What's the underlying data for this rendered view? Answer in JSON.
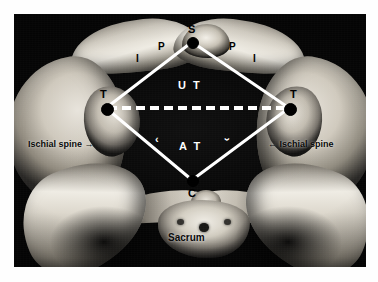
{
  "figure": {
    "background_color": "#050505",
    "overlay_line_color": "#ffffff",
    "label_color_dark": "#000000",
    "label_color_light": "#ffffff"
  },
  "vertices": [
    {
      "id": "S",
      "label": "S",
      "meaning": "symphysis-pubis",
      "x": 192,
      "y": 42
    },
    {
      "id": "T-left",
      "label": "T",
      "meaning": "ischial-tuberosity-left",
      "x": 106,
      "y": 108
    },
    {
      "id": "T-right",
      "label": "T",
      "meaning": "ischial-tuberosity-right",
      "x": 289,
      "y": 108
    },
    {
      "id": "C",
      "label": "C",
      "meaning": "coccyx",
      "x": 192,
      "y": 180
    }
  ],
  "region_labels": [
    {
      "id": "upper-triangle",
      "label": "U T",
      "x": 192,
      "y": 86
    },
    {
      "id": "anterior-triangle",
      "label": "A T",
      "x": 192,
      "y": 147
    }
  ],
  "bone_labels": [
    {
      "id": "pubic-ramus-left",
      "label": "P",
      "x": 162,
      "y": 48
    },
    {
      "id": "ischium-left",
      "label": "I",
      "x": 139,
      "y": 60
    },
    {
      "id": "pubic-ramus-right",
      "label": "P",
      "x": 232,
      "y": 48
    },
    {
      "id": "ischium-right",
      "label": "I",
      "x": 256,
      "y": 60
    }
  ],
  "angle_marks": [
    {
      "id": "angle-mark-left",
      "glyph": "‹",
      "x": 158,
      "y": 140
    },
    {
      "id": "angle-mark-right",
      "glyph": "‹",
      "x": 228,
      "y": 140
    }
  ],
  "annotations": [
    {
      "id": "ischial-spine-left",
      "text": "Ischial spine",
      "arrow": "→",
      "arrow_side": "right",
      "x": 34,
      "y": 145
    },
    {
      "id": "ischial-spine-right",
      "text": "Ischial spine",
      "arrow": "←",
      "arrow_side": "left",
      "x": 272,
      "y": 145
    },
    {
      "id": "sacrum",
      "text": "Sacrum",
      "arrow": "",
      "arrow_side": "none",
      "x": 192,
      "y": 238
    }
  ],
  "lines": {
    "solid_edges": [
      {
        "id": "edge-s-tleft",
        "from": "S",
        "to": "T-left"
      },
      {
        "id": "edge-s-tright",
        "from": "S",
        "to": "T-right"
      },
      {
        "id": "edge-c-tleft",
        "from": "C",
        "to": "T-left"
      },
      {
        "id": "edge-c-tright",
        "from": "C",
        "to": "T-right"
      }
    ],
    "dashed_edge": {
      "id": "edge-t-t",
      "from": "T-left",
      "to": "T-right",
      "style": "dashed",
      "dash_count": 13
    }
  }
}
